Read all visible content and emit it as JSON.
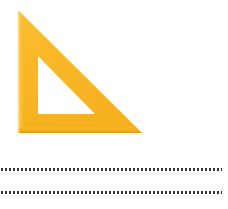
{
  "canvas": {
    "width": 228,
    "height": 209,
    "background_color": "#ffffff",
    "description": "Yellow set square drafting triangle above two dotted ruled lines"
  },
  "triangle": {
    "name": "set-square",
    "fill_color": "#F9B828",
    "highlight_color": "#FBC84E",
    "shadow_color": "#EDA31C",
    "edge_light_color": "#FCCC63",
    "outer_vertices": {
      "apex": [
        18,
        10
      ],
      "bottom_left": [
        18,
        133
      ],
      "bottom_right": [
        142,
        133
      ]
    },
    "inner_cutout_vertices": {
      "apex": [
        38,
        56
      ],
      "bottom_left": [
        38,
        114
      ],
      "bottom_right": [
        95,
        114
      ]
    },
    "ruler": {
      "edge": "hypotenuse",
      "tick_color": "#4A4130",
      "tick_count": 56,
      "major_tick_every": 2,
      "major_tick_length": 9,
      "minor_tick_length": 6
    }
  },
  "dotted_lines": {
    "count": 2,
    "color": "#343434",
    "dot_size_px": 2,
    "dot_gap_px": 2,
    "lines": [
      {
        "name": "dotted-rule-1",
        "x": 1,
        "y": 168,
        "width": 221
      },
      {
        "name": "dotted-rule-2",
        "x": 1,
        "y": 191,
        "width": 221
      }
    ]
  }
}
